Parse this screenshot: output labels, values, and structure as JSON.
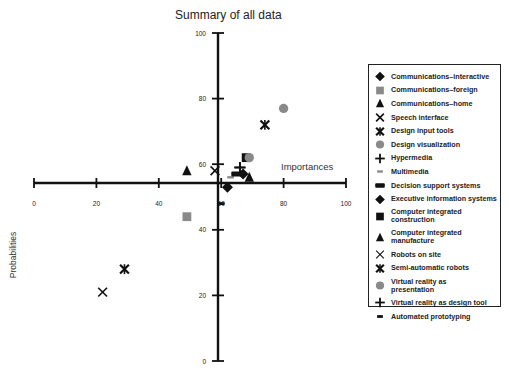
{
  "chart_data": {
    "type": "scatter",
    "title": "Summary of all data",
    "xlabel": "Importances",
    "ylabel": "Probabilities",
    "xlim": [
      0,
      100
    ],
    "ylim": [
      0,
      100
    ],
    "x_axis_crosses_y_at": 54,
    "y_axis_crosses_x_at": 59,
    "x_ticks": [
      0,
      20,
      40,
      60,
      80,
      100
    ],
    "y_ticks": [
      0,
      20,
      40,
      60,
      80,
      100
    ],
    "grid": false,
    "legend_position": "right",
    "series": [
      {
        "name": "Communications–interactive",
        "marker": "diamond",
        "color": "#111111",
        "x": 62,
        "y": 53
      },
      {
        "name": "Communications–foreign",
        "marker": "square",
        "color": "#8a8a8a",
        "x": 49,
        "y": 44
      },
      {
        "name": "Communications–home",
        "marker": "triangle",
        "color": "#111111",
        "x": 49,
        "y": 58
      },
      {
        "name": "Speech interface",
        "marker": "x",
        "color": "#111111",
        "x": 58,
        "y": 58
      },
      {
        "name": "Design input tools",
        "marker": "asterisk",
        "color": "#111111",
        "x": 74,
        "y": 72
      },
      {
        "name": "Design visualization",
        "marker": "circle",
        "color": "#8a8a8a",
        "x": 80,
        "y": 77
      },
      {
        "name": "Hypermedia",
        "marker": "plus",
        "color": "#111111",
        "x": 66,
        "y": 59
      },
      {
        "name": "Multimedia",
        "marker": "dash-gray",
        "color": "#8a8a8a",
        "x": 63,
        "y": 56
      },
      {
        "name": "Decision support systems",
        "marker": "bar",
        "color": "#111111",
        "x": 65,
        "y": 57
      },
      {
        "name": "Executive information systems",
        "marker": "diamond",
        "color": "#111111",
        "x": 67,
        "y": 57
      },
      {
        "name": "Computer integrated construction",
        "marker": "square",
        "color": "#111111",
        "x": 68,
        "y": 62
      },
      {
        "name": "Computer integrated manufacture",
        "marker": "triangle",
        "color": "#111111",
        "x": 69,
        "y": 56
      },
      {
        "name": "Robots on site",
        "marker": "x",
        "color": "#111111",
        "x": 22,
        "y": 21
      },
      {
        "name": "Semi-automatic robots",
        "marker": "asterisk",
        "color": "#111111",
        "x": 29,
        "y": 28
      },
      {
        "name": "Virtual reality as presentation",
        "marker": "circle",
        "color": "#8a8a8a",
        "x": 69,
        "y": 62
      },
      {
        "name": "Virtual reality as design tool",
        "marker": "plus",
        "color": "#111111",
        "x": 66,
        "y": 59
      },
      {
        "name": "Automated prototyping",
        "marker": "dash",
        "color": "#111111",
        "x": 60,
        "y": 48
      }
    ]
  },
  "labels": {
    "title": "Summary of all data",
    "xlabel": "Importances",
    "ylabel": "Probabilities"
  },
  "legend": [
    {
      "label": "Communications–interactive",
      "marker": "diamond"
    },
    {
      "label": "Communications–foreign",
      "marker": "square-gray"
    },
    {
      "label": "Communications–home",
      "marker": "triangle"
    },
    {
      "label": "Speech interface",
      "marker": "x"
    },
    {
      "label": "Design input tools",
      "marker": "asterisk"
    },
    {
      "label": "Design visualization",
      "marker": "circle-gray"
    },
    {
      "label": "Hypermedia",
      "marker": "plus"
    },
    {
      "label": "Multimedia",
      "marker": "dash-gray"
    },
    {
      "label": "Decision support systems",
      "marker": "bar"
    },
    {
      "label": "Executive information systems",
      "marker": "diamond"
    },
    {
      "label": "Computer integrated construction",
      "marker": "square"
    },
    {
      "label": "Computer integrated manufacture",
      "marker": "triangle"
    },
    {
      "label": "Robots on site",
      "marker": "x-thin"
    },
    {
      "label": "Semi-automatic robots",
      "marker": "asterisk"
    },
    {
      "label": "Virtual reality as presentation",
      "marker": "circle-gray"
    },
    {
      "label": "Virtual reality as design tool",
      "marker": "plus"
    },
    {
      "label": "Automated prototyping",
      "marker": "dash"
    }
  ]
}
